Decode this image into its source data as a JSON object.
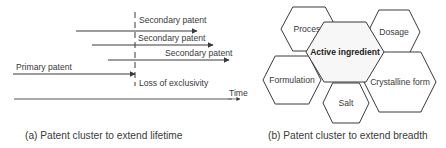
{
  "panel_a": {
    "caption": "(a) Patent cluster to extend lifetime",
    "secondary_patents": [
      {
        "label": "Secondary patent",
        "x1": 76,
        "x2": 197,
        "y": 31,
        "label_x": 139,
        "label_y": 23
      },
      {
        "label": "Secondary patent",
        "x1": 92,
        "x2": 213,
        "y": 45,
        "label_x": 138,
        "label_y": 41
      },
      {
        "label": "Secondary patent",
        "x1": 108,
        "x2": 229,
        "y": 60,
        "label_x": 165,
        "label_y": 56
      }
    ],
    "primary_patent": {
      "label": "Primary patent",
      "x1": 13,
      "x2": 135,
      "y": 74,
      "label_x": 16,
      "label_y": 70
    },
    "loss_of_exclusivity": "Loss of exclusivity",
    "time_axis_label": "Time"
  },
  "panel_b": {
    "caption": "(b) Patent cluster to extend breadth",
    "center": "Active ingredient",
    "hexagons": [
      {
        "label": "Process",
        "cx": 309,
        "cy": 29,
        "w": 56,
        "h": 44
      },
      {
        "label": "Dosage",
        "cx": 394,
        "cy": 32,
        "w": 52,
        "h": 44
      },
      {
        "label": "Formulation",
        "cx": 292,
        "cy": 80,
        "w": 58,
        "h": 48
      },
      {
        "label": "Crystalline form",
        "cx": 400,
        "cy": 82,
        "w": 72,
        "h": 60
      },
      {
        "label": "Salt",
        "cx": 346,
        "cy": 103,
        "w": 46,
        "h": 40
      }
    ]
  },
  "colors": {
    "line": "#3a3a3a",
    "text": "#3a3a3a",
    "hex_fill": "#ffffff",
    "center_fill": "#f7f7f7"
  }
}
